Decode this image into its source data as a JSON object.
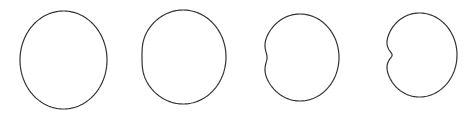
{
  "diagram": {
    "stroke_color": "#333333",
    "background": "#ffffff",
    "shapes": [
      {
        "id": "shape-1",
        "kind": "near-circle",
        "cx": 63.5,
        "cy": 60,
        "rx": 43.5,
        "ry": 49,
        "dent": 0.0
      },
      {
        "id": "shape-2",
        "kind": "flattened-circle",
        "cx": 184,
        "cy": 57,
        "rx": 42,
        "ry": 47,
        "dent": 0.18
      },
      {
        "id": "shape-3",
        "kind": "shallow-cardioid",
        "cx": 302,
        "cy": 57.5,
        "rx": 37,
        "ry": 43.5,
        "dent": 0.55
      },
      {
        "id": "shape-4",
        "kind": "cardioid",
        "cx": 422,
        "cy": 55,
        "rx": 35,
        "ry": 42,
        "dent": 0.85
      }
    ]
  }
}
